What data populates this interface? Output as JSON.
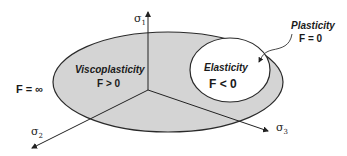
{
  "diagram": {
    "colors": {
      "outer_fill": "#d4d4d4",
      "inner_fill": "#ffffff",
      "stroke": "#2a2a2a"
    },
    "axes": [
      {
        "id": "sigma1",
        "symbol": "σ",
        "subscript": "1"
      },
      {
        "id": "sigma2",
        "symbol": "σ",
        "subscript": "2"
      },
      {
        "id": "sigma3",
        "symbol": "σ",
        "subscript": "3"
      }
    ],
    "regions": {
      "outer": {
        "title": "Viscoplasticity",
        "condition": "F > 0"
      },
      "inner": {
        "title": "Elasticity",
        "condition": "F < 0"
      },
      "boundary": {
        "title": "Plasticity",
        "condition": "F = 0"
      },
      "outside": {
        "condition": "F = ∞"
      }
    }
  }
}
